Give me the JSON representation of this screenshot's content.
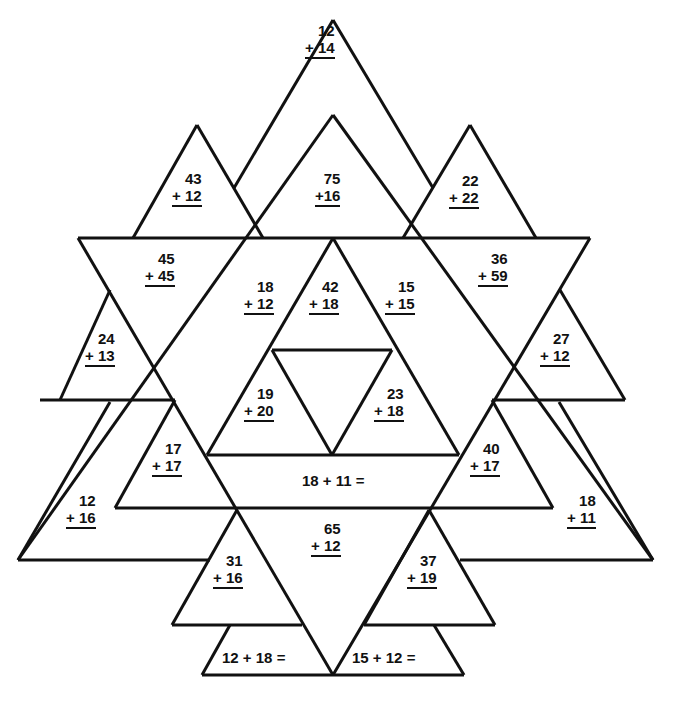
{
  "worksheet": {
    "vertical_problems": [
      {
        "id": "p1",
        "top": "12",
        "bottom": "+ 14",
        "x": 305,
        "y": 22
      },
      {
        "id": "p2",
        "top": "43",
        "bottom": "+ 12",
        "x": 172,
        "y": 170
      },
      {
        "id": "p3",
        "top": "75",
        "bottom": "+16",
        "x": 315,
        "y": 170
      },
      {
        "id": "p4",
        "top": "22",
        "bottom": "+ 22",
        "x": 449,
        "y": 172
      },
      {
        "id": "p5",
        "top": "45",
        "bottom": "+ 45",
        "x": 145,
        "y": 250
      },
      {
        "id": "p6",
        "top": "36",
        "bottom": "+ 59",
        "x": 478,
        "y": 250
      },
      {
        "id": "p7",
        "top": "18",
        "bottom": "+ 12",
        "x": 244,
        "y": 278
      },
      {
        "id": "p8",
        "top": "42",
        "bottom": "+ 18",
        "x": 309,
        "y": 278
      },
      {
        "id": "p9",
        "top": "15",
        "bottom": "+ 15",
        "x": 385,
        "y": 278
      },
      {
        "id": "p10",
        "top": "24",
        "bottom": "+ 13",
        "x": 85,
        "y": 330
      },
      {
        "id": "p11",
        "top": "27",
        "bottom": "+ 12",
        "x": 540,
        "y": 330
      },
      {
        "id": "p12",
        "top": "19",
        "bottom": "+ 20",
        "x": 244,
        "y": 385
      },
      {
        "id": "p13",
        "top": "23",
        "bottom": "+ 18",
        "x": 374,
        "y": 385
      },
      {
        "id": "p14",
        "top": "17",
        "bottom": "+ 17",
        "x": 152,
        "y": 440
      },
      {
        "id": "p15",
        "top": "40",
        "bottom": "+ 17",
        "x": 470,
        "y": 440
      },
      {
        "id": "p16",
        "top": "12",
        "bottom": "+ 16",
        "x": 66,
        "y": 492
      },
      {
        "id": "p17",
        "top": "18",
        "bottom": "+ 11",
        "x": 567,
        "y": 492
      },
      {
        "id": "p18",
        "top": "65",
        "bottom": "+ 12",
        "x": 311,
        "y": 520
      },
      {
        "id": "p19",
        "top": "31",
        "bottom": "+ 16",
        "x": 213,
        "y": 552
      },
      {
        "id": "p20",
        "top": "37",
        "bottom": "+ 19",
        "x": 407,
        "y": 552
      }
    ],
    "equations": [
      {
        "id": "e1",
        "text": "18 + 11 =",
        "x": 302,
        "y": 472
      },
      {
        "id": "e2",
        "text": "12 + 18 =",
        "x": 222,
        "y": 649
      },
      {
        "id": "e3",
        "text": "15 + 12 =",
        "x": 352,
        "y": 649
      }
    ],
    "line_color": "#111111",
    "background": "#ffffff"
  }
}
